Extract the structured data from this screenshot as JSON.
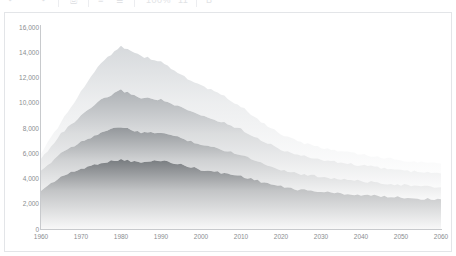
{
  "toolbar": {
    "items": [
      {
        "name": "undo-icon",
        "glyph": "↶"
      },
      {
        "name": "redo-icon",
        "glyph": "↷"
      },
      {
        "name": "print-icon",
        "glyph": "⎙"
      },
      {
        "name": "align-left-icon",
        "glyph": "≡"
      },
      {
        "name": "align-right-icon",
        "glyph": "≣"
      },
      {
        "name": "zoom-value",
        "glyph": "100%"
      },
      {
        "name": "font-size-value",
        "glyph": "11"
      },
      {
        "name": "bold-icon",
        "glyph": "B"
      }
    ]
  },
  "chart_data": {
    "type": "area",
    "stacked": true,
    "title": "",
    "subtitle": "",
    "xlabel": "",
    "ylabel": "",
    "grid": false,
    "legend": "none",
    "xlim": [
      1960,
      2060
    ],
    "ylim": [
      0,
      16000
    ],
    "x_ticks": [
      1960,
      1970,
      1980,
      1990,
      2000,
      2010,
      2020,
      2030,
      2040,
      2050,
      2060
    ],
    "x_tick_labels": [
      "1960",
      "1970",
      "1980",
      "1990",
      "2000",
      "2010",
      "2020",
      "2030",
      "2040",
      "2050",
      "2060"
    ],
    "y_ticks": [
      0,
      2000,
      4000,
      6000,
      8000,
      10000,
      12000,
      14000,
      16000
    ],
    "y_tick_labels": [
      "0",
      "2,000",
      "4,000",
      "6,000",
      "8,000",
      "10,000",
      "12,000",
      "14,000",
      "16,000"
    ],
    "x": [
      1960,
      1965,
      1970,
      1975,
      1980,
      1985,
      1990,
      1995,
      2000,
      2005,
      2010,
      2015,
      2020,
      2025,
      2030,
      2035,
      2040,
      2045,
      2050,
      2055,
      2060
    ],
    "series": [
      {
        "name": "Band 1",
        "color": "#6f7377",
        "values": [
          3050,
          4150,
          4750,
          5250,
          5500,
          5250,
          5450,
          5100,
          4700,
          4450,
          4200,
          3750,
          3350,
          3100,
          2950,
          2800,
          2700,
          2600,
          2500,
          2400,
          2350
        ]
      },
      {
        "name": "Band 2",
        "color": "#8e9296",
        "values": [
          1500,
          1900,
          2150,
          2400,
          2600,
          2350,
          2200,
          2100,
          2000,
          1850,
          1700,
          1500,
          1350,
          1250,
          1200,
          1150,
          1100,
          1050,
          1000,
          980,
          950
        ]
      },
      {
        "name": "Band 3",
        "color": "#a9adb1",
        "values": [
          1000,
          1500,
          2050,
          2550,
          2900,
          2800,
          2600,
          2400,
          2300,
          2200,
          2000,
          1800,
          1600,
          1450,
          1350,
          1300,
          1250,
          1200,
          1150,
          1120,
          1100
        ]
      },
      {
        "name": "Band 4",
        "color": "#d4d7da",
        "values": [
          450,
          900,
          1900,
          3000,
          3500,
          3300,
          3000,
          2600,
          2350,
          2150,
          1800,
          1450,
          1200,
          1050,
          950,
          900,
          850,
          820,
          800,
          790,
          780
        ]
      }
    ],
    "totals": [
      6000,
      8450,
      10850,
      13200,
      14500,
      13700,
      13250,
      12200,
      11350,
      10650,
      9700,
      8500,
      7500,
      6850,
      6450,
      6150,
      5900,
      5670,
      5450,
      5290,
      5180
    ]
  }
}
